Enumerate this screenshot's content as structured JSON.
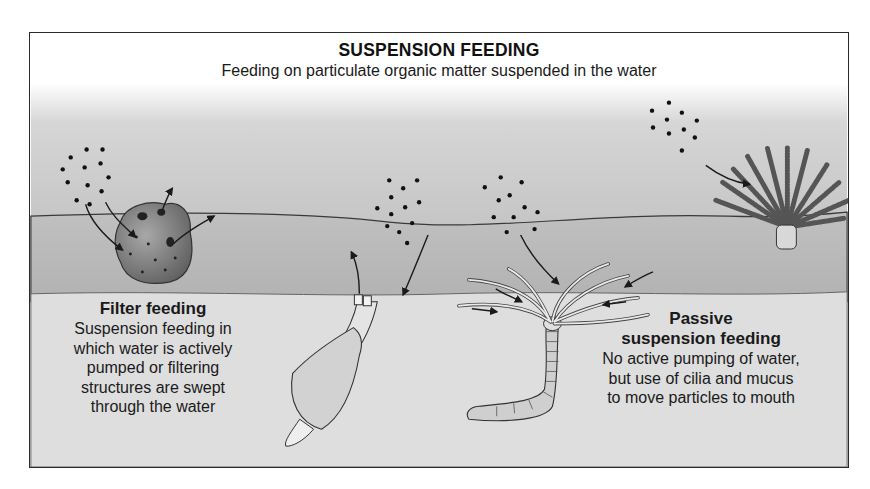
{
  "diagram": {
    "title": "SUSPENSION FEEDING",
    "subtitle": "Feeding on particulate organic matter suspended in the water",
    "colors": {
      "water_top": "#ffffff",
      "water_mid": "#c9c9c9",
      "sediment_surface": "#b9b9b9",
      "sediment_deep": "#dcdcdc",
      "ink": "#1a1a1a"
    },
    "organisms": [
      {
        "name": "sponge",
        "feeding_type": "filter feeding"
      },
      {
        "name": "clam",
        "feeding_type": "filter feeding"
      },
      {
        "name": "tube worm",
        "feeding_type": "passive suspension feeding"
      },
      {
        "name": "feather-duster / crinoid",
        "feeding_type": "passive suspension feeding"
      }
    ],
    "left_panel": {
      "heading": "Filter feeding",
      "lines": [
        "Suspension feeding in",
        "which water is actively",
        "pumped or filtering",
        "structures are swept",
        "through the water"
      ]
    },
    "right_panel": {
      "heading_line1": "Passive",
      "heading_line2": "suspension feeding",
      "lines": [
        "No active pumping of water,",
        "but use of cilia and mucus",
        "to move particles to mouth"
      ]
    }
  }
}
